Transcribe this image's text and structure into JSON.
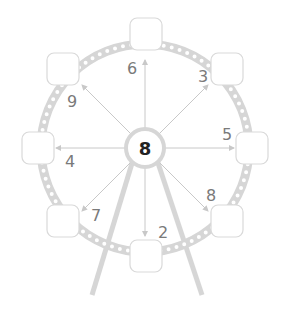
{
  "center": {
    "value": "8"
  },
  "spokes": [
    {
      "direction": "up",
      "label": "6"
    },
    {
      "direction": "up-right",
      "label": "3"
    },
    {
      "direction": "right",
      "label": "5"
    },
    {
      "direction": "down-right",
      "label": "8"
    },
    {
      "direction": "down",
      "label": "2"
    },
    {
      "direction": "down-left",
      "label": "7"
    },
    {
      "direction": "left",
      "label": "4"
    },
    {
      "direction": "up-left",
      "label": "9"
    }
  ],
  "colors": {
    "ring": "#d6d6d6",
    "box_border": "#d9d9d9",
    "arrow": "#c8c8c8",
    "text": "#7a7a7a",
    "center_text": "#222222"
  }
}
